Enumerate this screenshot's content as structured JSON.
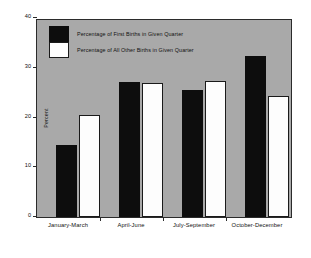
{
  "chart_data": {
    "type": "bar",
    "title": "",
    "xlabel": "",
    "ylabel": "Percent",
    "ylim": [
      0,
      40
    ],
    "yticks": [
      0,
      10,
      20,
      30,
      40
    ],
    "grid": false,
    "legend_position": "upper-left-inside",
    "categories": [
      "January-March",
      "April-June",
      "July-September",
      "October-December"
    ],
    "series": [
      {
        "name": "Percentage of First Births in Given Quarter",
        "color": "#0d0d0d",
        "values": [
          14.6,
          27.5,
          25.7,
          32.6
        ]
      },
      {
        "name": "Percentage of All Other Births in Given Quarter",
        "color": "#ffffff",
        "values": [
          20.7,
          27.3,
          27.7,
          24.5
        ]
      }
    ]
  },
  "axes": {
    "y_label": "Percent",
    "y_ticks": [
      "0",
      "10",
      "20",
      "30",
      "40"
    ],
    "x_ticks": [
      "January-March",
      "April-June",
      "July-September",
      "October-December"
    ]
  },
  "legend": {
    "entries": [
      {
        "label": "Percentage of First Births in Given Quarter",
        "swatch": "black"
      },
      {
        "label": "Percentage of All Other Births in Given Quarter",
        "swatch": "white"
      }
    ]
  },
  "colors": {
    "plot_background": "#a9a9a9",
    "figure_background": "#ffffff",
    "axis": "#2b2b2b",
    "series_first": "#0d0d0d",
    "series_other": "#ffffff"
  }
}
